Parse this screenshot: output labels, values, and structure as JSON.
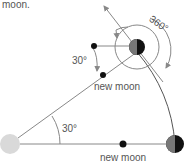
{
  "caption_fragment": "moon.",
  "labels": {
    "angle_upper": "30°",
    "angle_lower": "30°",
    "rotation": "360°",
    "new_moon_upper": "new moon",
    "new_moon_lower": "new moon"
  },
  "colors": {
    "line": "#888888",
    "earth": "#d9d9d9",
    "moon_dark": "#111111",
    "moon_shade": "#777777",
    "text": "#555555"
  }
}
